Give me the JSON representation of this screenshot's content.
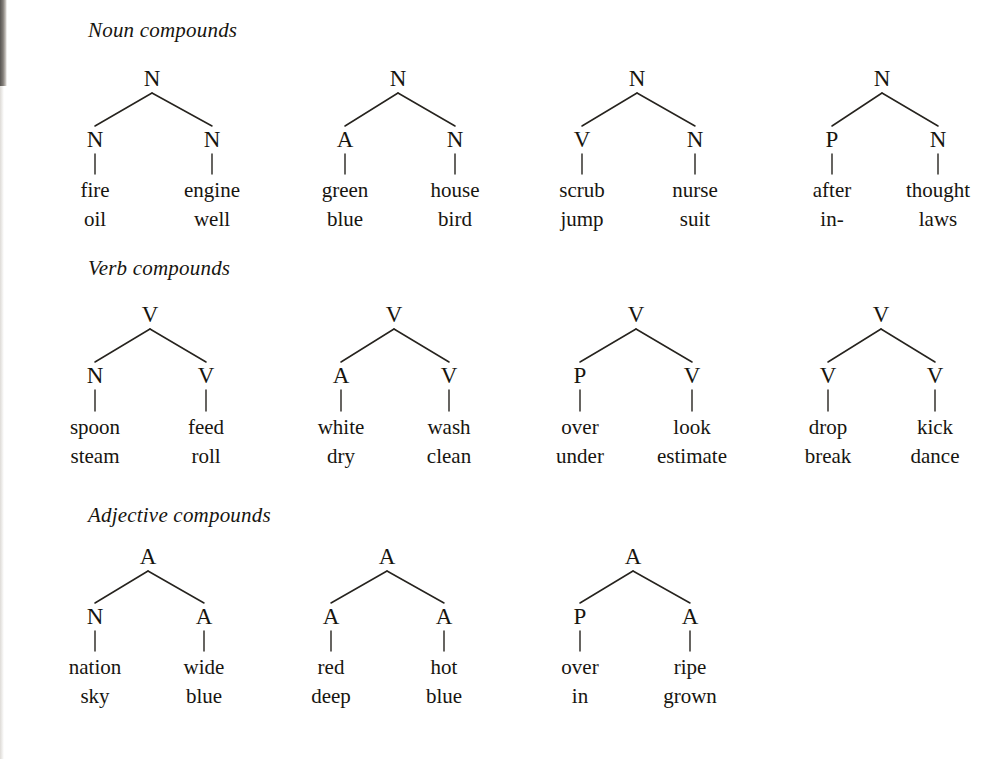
{
  "page": {
    "width": 1004,
    "height": 759,
    "background": "#ffffff",
    "ink_color": "#17150f"
  },
  "sections": [
    {
      "id": "noun-compounds",
      "heading": "Noun compounds",
      "heading_x": 88,
      "heading_y": 18,
      "root_y": 67,
      "child_y": 128,
      "word1_y": 180,
      "word2_y": 209,
      "trees": [
        {
          "id": "noun-tree-1",
          "root": "N",
          "root_x": 152,
          "left": {
            "label": "N",
            "x": 95,
            "words": [
              "fire",
              "oil"
            ]
          },
          "right": {
            "label": "N",
            "x": 212,
            "words": [
              "engine",
              "well"
            ]
          }
        },
        {
          "id": "noun-tree-2",
          "root": "N",
          "root_x": 398,
          "left": {
            "label": "A",
            "x": 345,
            "words": [
              "green",
              "blue"
            ]
          },
          "right": {
            "label": "N",
            "x": 455,
            "words": [
              "house",
              "bird"
            ]
          }
        },
        {
          "id": "noun-tree-3",
          "root": "N",
          "root_x": 637,
          "left": {
            "label": "V",
            "x": 582,
            "words": [
              "scrub",
              "jump"
            ]
          },
          "right": {
            "label": "N",
            "x": 695,
            "words": [
              "nurse",
              "suit"
            ]
          }
        },
        {
          "id": "noun-tree-4",
          "root": "N",
          "root_x": 882,
          "left": {
            "label": "P",
            "x": 832,
            "words": [
              "after",
              "in-"
            ]
          },
          "right": {
            "label": "N",
            "x": 938,
            "words": [
              "thought",
              "laws"
            ]
          }
        }
      ]
    },
    {
      "id": "verb-compounds",
      "heading": "Verb compounds",
      "heading_x": 88,
      "heading_y": 256,
      "root_y": 303,
      "child_y": 364,
      "word1_y": 417,
      "word2_y": 446,
      "trees": [
        {
          "id": "verb-tree-1",
          "root": "V",
          "root_x": 150,
          "left": {
            "label": "N",
            "x": 95,
            "words": [
              "spoon",
              "steam"
            ]
          },
          "right": {
            "label": "V",
            "x": 206,
            "words": [
              "feed",
              "roll"
            ]
          }
        },
        {
          "id": "verb-tree-2",
          "root": "V",
          "root_x": 394,
          "left": {
            "label": "A",
            "x": 341,
            "words": [
              "white",
              "dry"
            ]
          },
          "right": {
            "label": "V",
            "x": 449,
            "words": [
              "wash",
              "clean"
            ]
          }
        },
        {
          "id": "verb-tree-3",
          "root": "V",
          "root_x": 636,
          "left": {
            "label": "P",
            "x": 580,
            "words": [
              "over",
              "under"
            ]
          },
          "right": {
            "label": "V",
            "x": 692,
            "words": [
              "look",
              "estimate"
            ]
          }
        },
        {
          "id": "verb-tree-4",
          "root": "V",
          "root_x": 881,
          "left": {
            "label": "V",
            "x": 828,
            "words": [
              "drop",
              "break"
            ]
          },
          "right": {
            "label": "V",
            "x": 935,
            "words": [
              "kick",
              "dance"
            ]
          }
        }
      ]
    },
    {
      "id": "adjective-compounds",
      "heading": "Adjective compounds",
      "heading_x": 88,
      "heading_y": 503,
      "root_y": 545,
      "child_y": 605,
      "word1_y": 657,
      "word2_y": 686,
      "trees": [
        {
          "id": "adjective-tree-1",
          "root": "A",
          "root_x": 148,
          "left": {
            "label": "N",
            "x": 95,
            "words": [
              "nation",
              "sky"
            ]
          },
          "right": {
            "label": "A",
            "x": 204,
            "words": [
              "wide",
              "blue"
            ]
          }
        },
        {
          "id": "adjective-tree-2",
          "root": "A",
          "root_x": 387,
          "left": {
            "label": "A",
            "x": 331,
            "words": [
              "red",
              "deep"
            ]
          },
          "right": {
            "label": "A",
            "x": 444,
            "words": [
              "hot",
              "blue"
            ]
          }
        },
        {
          "id": "adjective-tree-3",
          "root": "A",
          "root_x": 633,
          "left": {
            "label": "P",
            "x": 580,
            "words": [
              "over",
              "in"
            ]
          },
          "right": {
            "label": "A",
            "x": 690,
            "words": [
              "ripe",
              "grown"
            ]
          }
        }
      ]
    }
  ]
}
